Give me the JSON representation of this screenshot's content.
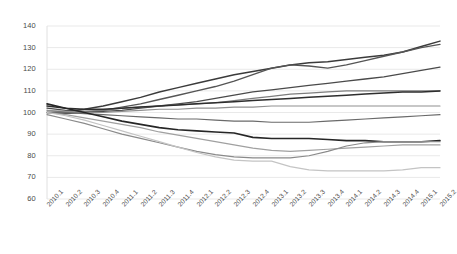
{
  "chart_data": {
    "type": "line",
    "title": "",
    "xlabel": "",
    "ylabel": "",
    "ylim": [
      60,
      140
    ],
    "yticks": [
      60,
      70,
      80,
      90,
      100,
      110,
      120,
      130,
      140
    ],
    "grid": true,
    "legend": "none",
    "x": [
      "2010.1",
      "2010.2",
      "2010.3",
      "2010.4",
      "2011.1",
      "2011.2",
      "2011.3",
      "2011.4",
      "2012.1",
      "2012.2",
      "2012.3",
      "2012.4",
      "2013.1",
      "2013.2",
      "2013.3",
      "2013.4",
      "2014.1",
      "2014.2",
      "2014.3",
      "2014.4",
      "2015.1",
      "2015.2"
    ],
    "series": [
      {
        "name": "series-1",
        "color": "#3b3b3b",
        "width": 1.5,
        "values": [
          100,
          100.5,
          101.5,
          103,
          105,
          107,
          109.5,
          111.5,
          113.5,
          115.5,
          117.5,
          119,
          120.5,
          122,
          123,
          123.5,
          124.5,
          125.5,
          126.5,
          128,
          130.5,
          133
        ]
      },
      {
        "name": "series-2",
        "color": "#555555",
        "width": 1.4,
        "values": [
          100,
          99.5,
          100,
          101,
          102.5,
          104,
          106,
          108,
          110,
          112,
          114.5,
          117.5,
          120.5,
          122,
          121.5,
          120.5,
          122,
          124,
          126,
          128,
          130,
          131.5
        ]
      },
      {
        "name": "series-3",
        "color": "#4a4a4a",
        "width": 1.3,
        "values": [
          102,
          101,
          100.5,
          100.5,
          101,
          102,
          103,
          104,
          105,
          106.5,
          108,
          109.5,
          110.5,
          111.5,
          112.5,
          113.5,
          114.5,
          115.5,
          116.5,
          118,
          119.5,
          121
        ]
      },
      {
        "name": "series-4",
        "color": "#7d7d7d",
        "width": 1.2,
        "values": [
          100,
          100,
          100.5,
          101,
          102,
          102.5,
          103,
          103.5,
          104,
          104.5,
          105.5,
          106.5,
          107.5,
          108.5,
          109,
          109.5,
          110,
          110,
          110,
          110,
          110,
          110
        ]
      },
      {
        "name": "series-5",
        "color": "#2e2e2e",
        "width": 1.5,
        "values": [
          103,
          102,
          101.5,
          101.5,
          102,
          102.5,
          103,
          103.5,
          104,
          104.5,
          105,
          105.5,
          106,
          106.5,
          107,
          107.5,
          108,
          108.5,
          109,
          109.5,
          109.5,
          110
        ]
      },
      {
        "name": "series-6",
        "color": "#909090",
        "width": 1.2,
        "values": [
          101,
          100.5,
          100,
          100,
          100.5,
          101,
          101.5,
          101.5,
          102,
          102,
          102.5,
          102.5,
          103,
          103,
          103,
          103,
          103,
          103,
          103,
          103,
          103,
          103
        ]
      },
      {
        "name": "series-7",
        "color": "#6a6a6a",
        "width": 1.2,
        "values": [
          100,
          100,
          99.5,
          99,
          98.5,
          98,
          97.5,
          97,
          97,
          96.5,
          96,
          96,
          95.5,
          95.5,
          95.5,
          96,
          96.5,
          97,
          97.5,
          98,
          98.5,
          99
        ]
      },
      {
        "name": "series-8",
        "color": "#262626",
        "width": 1.6,
        "values": [
          104,
          102,
          100,
          98,
          96,
          94.5,
          93,
          92,
          91.5,
          91,
          90.5,
          88.5,
          88,
          88,
          88,
          87.5,
          87,
          87,
          86.5,
          86.5,
          86.5,
          87
        ]
      },
      {
        "name": "series-9",
        "color": "#a0a0a0",
        "width": 1.2,
        "values": [
          100,
          99,
          97.5,
          96,
          94.5,
          93,
          91,
          89.5,
          88,
          86.5,
          85,
          83.5,
          82.5,
          82,
          82.5,
          83,
          83.5,
          84,
          84.5,
          85,
          85,
          85
        ]
      },
      {
        "name": "series-10",
        "color": "#8a8a8a",
        "width": 1.2,
        "values": [
          99,
          97,
          95,
          92.5,
          90,
          88,
          86,
          84,
          82,
          80.5,
          79.5,
          79,
          79,
          79,
          80,
          82,
          84.5,
          86,
          86.5,
          86.5,
          86.5,
          86.5
        ]
      },
      {
        "name": "series-11",
        "color": "#c4c4c4",
        "width": 1.2,
        "values": [
          100,
          98.5,
          96.5,
          94,
          91.5,
          89,
          86.5,
          84,
          81.5,
          79.5,
          78,
          77.5,
          77.5,
          75,
          73.5,
          73,
          73,
          73,
          73,
          73.5,
          74.5,
          74.5
        ]
      }
    ]
  },
  "axes": {
    "y_axis_name": "index-value-axis",
    "x_axis_name": "quarter-axis"
  }
}
